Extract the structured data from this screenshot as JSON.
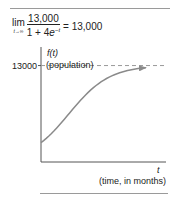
{
  "formula": {
    "lim_word": "lim",
    "lim_subscript": "t→∞",
    "numerator": "13,000",
    "denominator_prefix": "1 + 4",
    "denominator_base": "e",
    "denominator_exponent": "−t",
    "equals_result": "= 13,000"
  },
  "chart_data": {
    "type": "line",
    "title": "",
    "function": "f(t) = 13000 / (1 + 4e^(-t))",
    "xlabel_symbol": "t",
    "xlabel": "(time, in months)",
    "ylabel_symbol": "f(t)",
    "ylabel": "(population)",
    "ylim": [
      0,
      15500
    ],
    "xlim": [
      0,
      6
    ],
    "asymptote": {
      "value": 13000,
      "label": "13000",
      "style": "dashed"
    },
    "yticks": [
      13000
    ],
    "ytick_labels": [
      "13000"
    ],
    "grid": false,
    "legend": "none",
    "series": [
      {
        "name": "f(t)",
        "color": "#8a8a8a",
        "samples": 40,
        "t_start": 0,
        "t_end": 5.2
      }
    ],
    "colors": {
      "axis": "#555555",
      "curve": "#8a8a8a",
      "asymptote": "#9a9a9a",
      "rule": "#9a9a9a"
    }
  }
}
